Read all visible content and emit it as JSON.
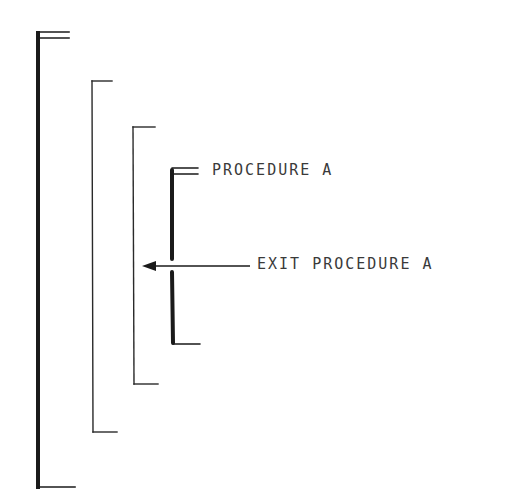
{
  "diagram": {
    "type": "nested-block-structure",
    "colors": {
      "line": "#1a1a1a",
      "text": "#3a3a3a",
      "background": "#ffffff"
    },
    "brackets": [
      {
        "id": "outer-block",
        "level": 1,
        "weight": "thick"
      },
      {
        "id": "block-2",
        "level": 2,
        "weight": "thin"
      },
      {
        "id": "block-3",
        "level": 3,
        "weight": "thin"
      },
      {
        "id": "procedure-a-block",
        "level": 4,
        "weight": "thick"
      }
    ],
    "labels": {
      "procedure": "PROCEDURE A",
      "exit": "EXIT PROCEDURE A"
    },
    "arrow": {
      "direction": "left",
      "label": "EXIT PROCEDURE A"
    }
  }
}
